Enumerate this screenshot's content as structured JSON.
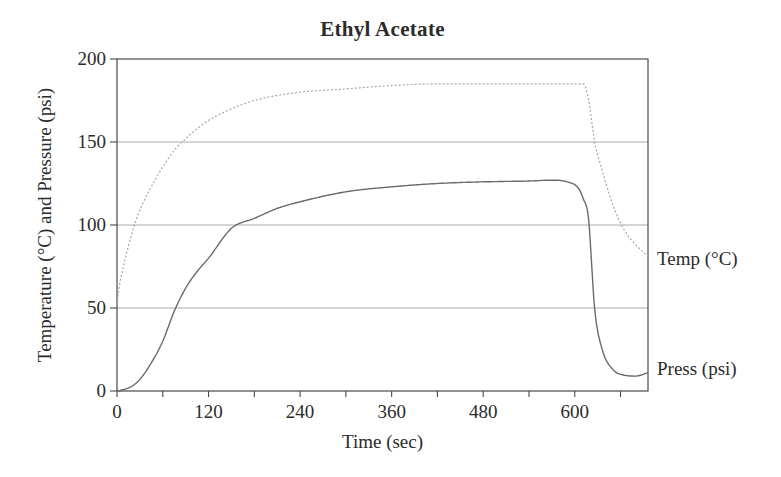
{
  "title": "Ethyl Acetate",
  "y_axis": {
    "label": "Temperature (°C) and Pressure (psi)",
    "tick_labels": [
      0,
      50,
      100,
      150,
      200
    ],
    "gridlines": [
      50,
      100,
      150
    ]
  },
  "x_axis": {
    "label": "Time (sec)",
    "tick_labels": [
      0,
      120,
      240,
      360,
      480,
      600
    ],
    "all_ticks": [
      0,
      60,
      120,
      180,
      240,
      300,
      360,
      420,
      480,
      540,
      600,
      660
    ]
  },
  "series_labels": {
    "temp": "Temp (°C)",
    "press": "Press (psi)"
  },
  "colors": {
    "background": "#ffffff",
    "frame": "#4a4a4a",
    "gridline": "#8d8d8d",
    "text": "#2b2b2b",
    "temp_curve": "#a6a6a6",
    "press_curve": "#6b6b6b"
  },
  "chart_data": {
    "type": "line",
    "title": "Ethyl Acetate",
    "xlabel": "Time (sec)",
    "ylabel": "Temperature (°C) and Pressure (psi)",
    "xlim": [
      0,
      696
    ],
    "ylim": [
      0,
      200
    ],
    "x_major_ticks": [
      0,
      120,
      240,
      360,
      480,
      600
    ],
    "x_minor_tick_step": 60,
    "y_ticks": [
      0,
      50,
      100,
      150,
      200
    ],
    "grid": "horizontal gridlines at 50, 100, 150; full rectangular frame",
    "legend_position": "inline labels right of plot",
    "x": [
      0,
      4,
      7,
      10,
      20,
      30,
      45,
      60,
      75,
      90,
      105,
      120,
      150,
      180,
      210,
      240,
      300,
      360,
      420,
      480,
      540,
      570,
      590,
      605,
      611,
      618,
      626,
      636,
      650,
      665,
      680,
      696
    ],
    "series": [
      {
        "name": "Temp (°C)",
        "style": "dotted",
        "values": [
          52,
          66,
          72,
          78,
          96,
          109,
          123,
          135,
          145,
          152,
          158,
          163,
          170,
          175,
          178,
          180,
          182,
          184,
          185,
          185,
          185,
          185,
          185,
          185,
          185,
          176,
          150,
          133,
          112,
          97,
          88,
          81
        ]
      },
      {
        "name": "Press (psi)",
        "style": "solid",
        "values": [
          0,
          0.3,
          0.7,
          1,
          3,
          7,
          17,
          30,
          48,
          62,
          72,
          80,
          98,
          104,
          110,
          114,
          120,
          123,
          125,
          126,
          126.5,
          127,
          126,
          122,
          116,
          104,
          50,
          25,
          13,
          9.5,
          9,
          11
        ]
      }
    ]
  }
}
